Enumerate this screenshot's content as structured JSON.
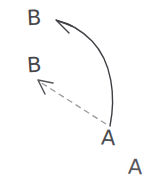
{
  "canvas": {
    "width": 152,
    "height": 181,
    "background_color": "#ffffff",
    "description": "Hand-drawn sketch: two arrows leaving a point labelled A and reaching two points labelled B"
  },
  "labels": {
    "b_top": "B",
    "b_mid": "B",
    "a_origin": "A",
    "a_corner": "A"
  },
  "colors": {
    "ink": "#4a4a4f",
    "solid_stroke": "#3f3f45",
    "dashed_stroke": "#9a9aa0",
    "dashed_arrowhead": "#55555b",
    "background": "#ffffff"
  },
  "strokes": {
    "solid_arrow": {
      "name": "curved-solid-arrow",
      "style": "solid",
      "from_label": "A",
      "to_label": "B",
      "start": [
        110,
        126
      ],
      "end": [
        58,
        21
      ],
      "curvature": "bows right (convex toward right edge)",
      "path": "M110,126 C116,96 112,62 92,41 C80,29 68,23 58,21",
      "width": 1.4,
      "arrowhead": {
        "type": "open-v",
        "tip": [
          56,
          20
        ],
        "path": "M56,20 L72,26 M56,20 L69,33"
      }
    },
    "dashed_arrow": {
      "name": "straight-dashed-arrow",
      "style": "dashed",
      "from_label": "A",
      "to_label": "B",
      "start": [
        106,
        124
      ],
      "end": [
        40,
        82
      ],
      "path": "M106,124 L40,82",
      "width": 1.3,
      "dash_pattern": "6 4",
      "arrowhead": {
        "type": "open-v",
        "tip": [
          38,
          80
        ],
        "path": "M38,80 L53,83 M38,80 L45,94"
      }
    }
  },
  "annotations": {
    "solid_arrow_meaning": "curved path from A to upper B",
    "dashed_arrow_meaning": "straight dashed path from A to middle B",
    "isolated_a_meaning": "stray A label at lower right"
  }
}
